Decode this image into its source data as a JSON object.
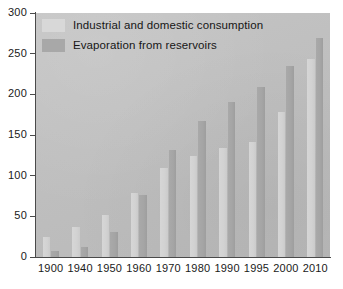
{
  "chart_data": {
    "type": "bar",
    "title": "",
    "subtitle": "",
    "xlabel": "",
    "ylabel": "",
    "categories": [
      "1900",
      "1940",
      "1950",
      "1960",
      "1970",
      "1980",
      "1990",
      "1995",
      "2000",
      "2010"
    ],
    "series": [
      {
        "name": "Industrial and domestic consumption",
        "color": "#d4d4d4",
        "values": [
          25,
          37,
          52,
          79,
          110,
          124,
          134,
          142,
          178,
          244
        ]
      },
      {
        "name": "Evaporation from reservoirs",
        "color": "#a7a7a7",
        "values": [
          8,
          12,
          31,
          76,
          131,
          167,
          190,
          209,
          235,
          269
        ]
      }
    ],
    "ylim": [
      0,
      300
    ],
    "yticks": [
      0,
      50,
      100,
      150,
      200,
      250,
      300
    ],
    "ytick_labels": [
      "0",
      "50",
      "100",
      "150",
      "200",
      "250",
      "300"
    ],
    "grid": false,
    "legend_position": "top-left",
    "plot_background": "#c1c1c1",
    "axis_color": "#4a4a4a"
  },
  "legend": {
    "entries": [
      {
        "label": "Industrial and domestic consumption",
        "swatch": "light"
      },
      {
        "label": "Evaporation from reservoirs",
        "swatch": "dark"
      }
    ]
  }
}
